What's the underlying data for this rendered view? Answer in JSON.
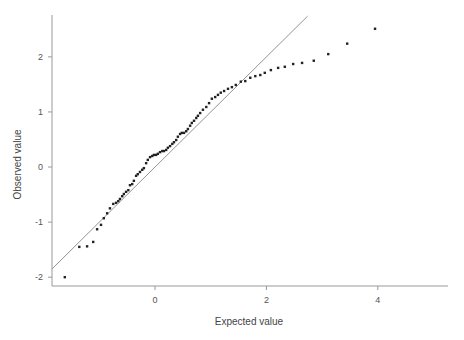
{
  "chart_data": {
    "type": "scatter",
    "title": "",
    "xlabel": "Expected value",
    "ylabel": "Observed value",
    "xlim": [
      -1.85,
      5.26
    ],
    "ylim": [
      -2.16,
      2.76
    ],
    "xticks": [
      0,
      2,
      4
    ],
    "xtick_labels": [
      "0",
      "2",
      "4"
    ],
    "yticks": [
      -2,
      -1,
      0,
      1,
      2
    ],
    "ytick_labels": [
      "-2",
      "-1",
      "0",
      "1",
      "2"
    ],
    "grid": false,
    "legend": "none",
    "reference_line": {
      "name": "y = x",
      "slope": 1,
      "intercept": 0,
      "x_range": [
        -1.85,
        2.74
      ]
    },
    "colors": {
      "points": "#222222",
      "line": "#888888",
      "axis": "#999999"
    },
    "series": [
      {
        "name": "Observed vs expected",
        "points": [
          [
            -1.62,
            -2.0
          ],
          [
            -1.36,
            -1.45
          ],
          [
            -1.22,
            -1.44
          ],
          [
            -1.11,
            -1.36
          ],
          [
            -1.04,
            -1.13
          ],
          [
            -0.97,
            -1.05
          ],
          [
            -0.92,
            -0.93
          ],
          [
            -0.86,
            -0.84
          ],
          [
            -0.81,
            -0.75
          ],
          [
            -0.75,
            -0.67
          ],
          [
            -0.7,
            -0.65
          ],
          [
            -0.66,
            -0.62
          ],
          [
            -0.63,
            -0.58
          ],
          [
            -0.59,
            -0.53
          ],
          [
            -0.56,
            -0.49
          ],
          [
            -0.52,
            -0.45
          ],
          [
            -0.48,
            -0.42
          ],
          [
            -0.45,
            -0.33
          ],
          [
            -0.41,
            -0.31
          ],
          [
            -0.38,
            -0.25
          ],
          [
            -0.34,
            -0.16
          ],
          [
            -0.31,
            -0.13
          ],
          [
            -0.27,
            -0.09
          ],
          [
            -0.23,
            -0.05
          ],
          [
            -0.2,
            -0.02
          ],
          [
            -0.16,
            0.07
          ],
          [
            -0.13,
            0.13
          ],
          [
            -0.09,
            0.18
          ],
          [
            -0.05,
            0.2
          ],
          [
            -0.02,
            0.22
          ],
          [
            0.02,
            0.22
          ],
          [
            0.05,
            0.24
          ],
          [
            0.09,
            0.27
          ],
          [
            0.13,
            0.29
          ],
          [
            0.16,
            0.29
          ],
          [
            0.2,
            0.31
          ],
          [
            0.23,
            0.35
          ],
          [
            0.27,
            0.38
          ],
          [
            0.31,
            0.42
          ],
          [
            0.34,
            0.45
          ],
          [
            0.38,
            0.49
          ],
          [
            0.41,
            0.55
          ],
          [
            0.45,
            0.6
          ],
          [
            0.48,
            0.62
          ],
          [
            0.52,
            0.62
          ],
          [
            0.56,
            0.65
          ],
          [
            0.59,
            0.69
          ],
          [
            0.63,
            0.75
          ],
          [
            0.66,
            0.8
          ],
          [
            0.7,
            0.84
          ],
          [
            0.74,
            0.89
          ],
          [
            0.77,
            0.93
          ],
          [
            0.81,
            0.98
          ],
          [
            0.86,
            1.04
          ],
          [
            0.92,
            1.09
          ],
          [
            0.97,
            1.16
          ],
          [
            1.02,
            1.24
          ],
          [
            1.08,
            1.27
          ],
          [
            1.13,
            1.31
          ],
          [
            1.18,
            1.35
          ],
          [
            1.24,
            1.38
          ],
          [
            1.31,
            1.42
          ],
          [
            1.38,
            1.45
          ],
          [
            1.45,
            1.49
          ],
          [
            1.54,
            1.55
          ],
          [
            1.62,
            1.56
          ],
          [
            1.71,
            1.62
          ],
          [
            1.8,
            1.65
          ],
          [
            1.89,
            1.67
          ],
          [
            1.97,
            1.71
          ],
          [
            2.08,
            1.76
          ],
          [
            2.21,
            1.8
          ],
          [
            2.33,
            1.82
          ],
          [
            2.48,
            1.87
          ],
          [
            2.64,
            1.89
          ],
          [
            2.85,
            1.93
          ],
          [
            3.11,
            2.05
          ],
          [
            3.45,
            2.24
          ],
          [
            3.95,
            2.51
          ]
        ]
      }
    ]
  }
}
